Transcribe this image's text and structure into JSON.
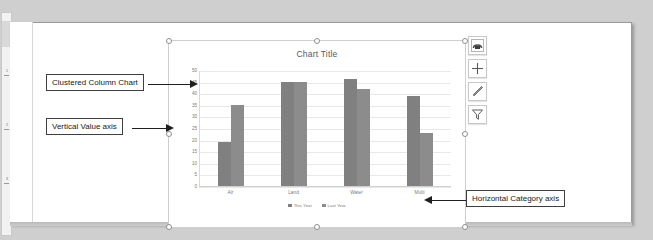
{
  "document": {
    "background_color": "#cfcfcf",
    "page_color": "#ffffff"
  },
  "ruler": {
    "name": "vertical-ruler",
    "marks": [
      "1",
      "2",
      "3"
    ]
  },
  "chart_object": {
    "selected": true,
    "handle_count": 8
  },
  "side_buttons": [
    {
      "name": "chart-layout-button",
      "icon": "chart-layout-icon",
      "tooltip": "Layout Options"
    },
    {
      "name": "chart-elements-button",
      "icon": "plus-icon",
      "tooltip": "Chart Elements"
    },
    {
      "name": "chart-styles-button",
      "icon": "paintbrush-icon",
      "tooltip": "Chart Styles"
    },
    {
      "name": "chart-filters-button",
      "icon": "funnel-icon",
      "tooltip": "Chart Filters"
    }
  ],
  "annotations": [
    {
      "id": "a1",
      "label": "Clustered Column Chart"
    },
    {
      "id": "a2",
      "label": "Vertical Value axis"
    },
    {
      "id": "a3",
      "label": "Horizontal Category axis"
    }
  ],
  "chart_data": {
    "type": "bar",
    "title": "Chart Title",
    "xlabel": "",
    "ylabel": "",
    "categories": [
      "Air",
      "Land",
      "Water",
      "Multi"
    ],
    "series": [
      {
        "name": "This Year",
        "color": "#808080",
        "values": [
          19,
          45,
          46,
          39
        ]
      },
      {
        "name": "Last Year",
        "color": "#8c8c8c",
        "values": [
          35,
          45,
          42,
          23
        ]
      }
    ],
    "ylim": [
      0,
      50
    ],
    "yticks": [
      50,
      45,
      40,
      35,
      30,
      25,
      20,
      15,
      10,
      5,
      0
    ],
    "ytick_labels": [
      "50",
      "45",
      "40",
      "35",
      "30",
      "25",
      "20",
      "15",
      "10",
      "5",
      "0"
    ],
    "grid": true,
    "legend_position": "bottom"
  }
}
